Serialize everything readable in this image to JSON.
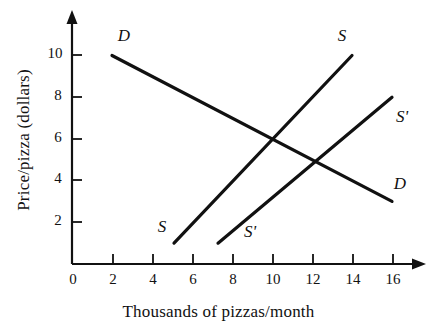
{
  "chart_data": {
    "type": "line",
    "title": "",
    "xlabel": "Thousands of pizzas/month",
    "ylabel": "Price/pizza (dollars)",
    "xlim": [
      0,
      16.8
    ],
    "ylim": [
      0,
      11.2
    ],
    "xticks": [
      0,
      2,
      4,
      6,
      8,
      10,
      12,
      14,
      16
    ],
    "xtick_labels": [
      "0",
      "2",
      "4",
      "6",
      "8",
      "10",
      "12",
      "14",
      "16"
    ],
    "yticks": [
      2,
      4,
      6,
      8,
      10
    ],
    "ytick_labels": [
      "2",
      "4",
      "6",
      "8",
      "10"
    ],
    "grid": false,
    "legend": "inline-curve-labels",
    "axis_style": "arrow-tipped-open-axes",
    "line_color": "#111111",
    "background_color": "#ffffff",
    "series": [
      {
        "name": "D",
        "role": "demand",
        "x": [
          2,
          16
        ],
        "y": [
          10,
          3
        ],
        "labels": [
          {
            "text": "D",
            "x": 2.6,
            "y": 10.9
          },
          {
            "text": "D",
            "x": 16.4,
            "y": 3.8
          }
        ]
      },
      {
        "name": "S",
        "role": "supply-original",
        "x": [
          5.1,
          14
        ],
        "y": [
          1.0,
          10
        ],
        "labels": [
          {
            "text": "S",
            "x": 4.5,
            "y": 1.7
          },
          {
            "text": "S",
            "x": 13.5,
            "y": 10.9
          }
        ]
      },
      {
        "name": "S'",
        "role": "supply-shifted",
        "x": [
          7.3,
          16
        ],
        "y": [
          1.0,
          8
        ],
        "labels": [
          {
            "text": "S'",
            "x": 8.9,
            "y": 1.5
          },
          {
            "text": "S'",
            "x": 16.5,
            "y": 7.0
          }
        ]
      }
    ],
    "intersections": [
      {
        "curves": [
          "D",
          "S"
        ],
        "x": 10,
        "y": 6
      },
      {
        "curves": [
          "D",
          "S'"
        ],
        "x": 12,
        "y": 5
      }
    ]
  },
  "axes": {
    "x_title": "Thousands of pizzas/month",
    "y_title": "Price/pizza (dollars)"
  },
  "ticks": {
    "x": [
      "0",
      "2",
      "4",
      "6",
      "8",
      "10",
      "12",
      "14",
      "16"
    ],
    "y": [
      "2",
      "4",
      "6",
      "8",
      "10"
    ]
  },
  "curve_labels": {
    "demand_top": "D",
    "demand_right": "D",
    "supply_bottom": "S",
    "supply_top": "S",
    "supply_shifted_bottom": "S'",
    "supply_shifted_right": "S'"
  }
}
